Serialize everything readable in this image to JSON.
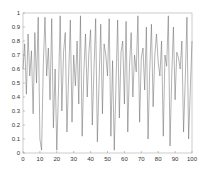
{
  "chart_data": {
    "type": "line",
    "title": "",
    "xlabel": "",
    "ylabel": "",
    "xlim": [
      0,
      100
    ],
    "ylim": [
      0,
      1
    ],
    "grid": false,
    "legend": null,
    "x_ticks": [
      "0",
      "10",
      "20",
      "30",
      "40",
      "50",
      "60",
      "70",
      "80",
      "90",
      "100"
    ],
    "y_ticks": [
      "0",
      "0.1",
      "0.2",
      "0.3",
      "0.4",
      "0.5",
      "0.6",
      "0.7",
      "0.8",
      "0.9",
      "1"
    ],
    "line_color": "#666666",
    "series": [
      {
        "name": "series-1",
        "x": [
          0,
          1,
          2,
          3,
          4,
          5,
          6,
          7,
          8,
          9,
          10,
          11,
          12,
          13,
          14,
          15,
          16,
          17,
          18,
          19,
          20,
          21,
          22,
          23,
          24,
          25,
          26,
          27,
          28,
          29,
          30,
          31,
          32,
          33,
          34,
          35,
          36,
          37,
          38,
          39,
          40,
          41,
          42,
          43,
          44,
          45,
          46,
          47,
          48,
          49,
          50,
          51,
          52,
          53,
          54,
          55,
          56,
          57,
          58,
          59,
          60,
          61,
          62,
          63,
          64,
          65,
          66,
          67,
          68,
          69,
          70,
          71,
          72,
          73,
          74,
          75,
          76,
          77,
          78,
          79,
          80,
          81,
          82,
          83,
          84,
          85,
          86,
          87,
          88,
          89,
          90,
          91,
          92,
          93,
          94,
          95,
          96,
          97,
          98,
          99,
          100
        ],
        "values": [
          0.6,
          0.78,
          0.42,
          0.85,
          0.55,
          0.73,
          0.28,
          0.86,
          0.5,
          0.97,
          0.1,
          0.02,
          0.62,
          0.97,
          0.55,
          0.75,
          0.38,
          0.96,
          0.18,
          0.6,
          0.02,
          0.45,
          0.98,
          0.3,
          0.72,
          0.86,
          0.15,
          0.55,
          0.95,
          0.22,
          0.7,
          0.48,
          0.8,
          0.35,
          0.98,
          0.12,
          0.58,
          0.85,
          0.4,
          0.72,
          0.88,
          0.2,
          0.6,
          0.96,
          0.08,
          0.5,
          0.92,
          0.28,
          0.78,
          0.7,
          0.55,
          0.96,
          0.12,
          0.66,
          0.02,
          0.48,
          0.95,
          0.25,
          0.72,
          0.8,
          0.35,
          0.94,
          0.15,
          0.62,
          0.86,
          0.4,
          0.7,
          0.58,
          0.98,
          0.22,
          0.68,
          0.75,
          0.45,
          0.9,
          0.1,
          0.6,
          0.92,
          0.33,
          0.7,
          0.85,
          0.65,
          0.55,
          0.8,
          0.12,
          0.7,
          0.62,
          0.98,
          0.05,
          0.55,
          0.9,
          0.38,
          0.72,
          0.68,
          0.6,
          0.8,
          0.15,
          0.52,
          0.97,
          0.1,
          0.45,
          0.8
        ]
      }
    ]
  }
}
